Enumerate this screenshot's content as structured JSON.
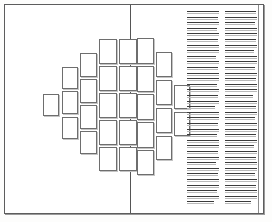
{
  "document": {
    "title": "Page Layout Mockup",
    "kind": "two-page-spread-wireframe",
    "description": "Bordered page spread with a diagonal cluster of photo placeholder tiles on the left and a two-column block of body-text rule lines on the right.",
    "canvas": {
      "width": 272,
      "height": 222,
      "background": "#ffffff"
    }
  },
  "frame": {
    "name": "outer-border",
    "x": 4,
    "y": 4,
    "width": 260,
    "height": 210,
    "stroke": "#5d5d5d",
    "shadow_stroke": "#9a9a9a",
    "inner_rule": {
      "name": "right-inner-rule",
      "x": 258,
      "y": 5,
      "height": 208,
      "stroke": "#8c8c8c"
    }
  },
  "spine": {
    "name": "vertical-divider",
    "x": 130,
    "y": 5,
    "height": 208,
    "stroke": "#555555"
  },
  "panels": {
    "left": {
      "name": "left-page",
      "x": 5,
      "y": 5,
      "width": 125,
      "height": 208
    },
    "right": {
      "name": "right-page",
      "x": 131,
      "y": 5,
      "width": 127,
      "height": 208
    }
  },
  "photo_grid": {
    "label": "photo-placeholder-cluster",
    "tile_stroke": "#6e6e6e",
    "tile_fill": "#ffffff",
    "tile_shadow": "#c4c4c4",
    "tile_count": 28,
    "tiles": [
      {
        "id": "t01",
        "x": 43,
        "y": 94,
        "w": 16,
        "h": 22
      },
      {
        "id": "t02",
        "x": 62,
        "y": 91,
        "w": 16,
        "h": 23
      },
      {
        "id": "t03",
        "x": 62,
        "y": 67,
        "w": 16,
        "h": 22
      },
      {
        "id": "t04",
        "x": 62,
        "y": 117,
        "w": 16,
        "h": 22
      },
      {
        "id": "t05",
        "x": 80,
        "y": 53,
        "w": 17,
        "h": 24
      },
      {
        "id": "t06",
        "x": 80,
        "y": 79,
        "w": 17,
        "h": 24
      },
      {
        "id": "t07",
        "x": 80,
        "y": 105,
        "w": 17,
        "h": 24
      },
      {
        "id": "t08",
        "x": 80,
        "y": 131,
        "w": 17,
        "h": 23
      },
      {
        "id": "t09",
        "x": 99,
        "y": 39,
        "w": 18,
        "h": 25
      },
      {
        "id": "t10",
        "x": 99,
        "y": 66,
        "w": 18,
        "h": 25
      },
      {
        "id": "t11",
        "x": 99,
        "y": 93,
        "w": 18,
        "h": 25
      },
      {
        "id": "t12",
        "x": 99,
        "y": 120,
        "w": 18,
        "h": 25
      },
      {
        "id": "t13",
        "x": 99,
        "y": 147,
        "w": 18,
        "h": 24
      },
      {
        "id": "t14",
        "x": 119,
        "y": 39,
        "w": 18,
        "h": 25
      },
      {
        "id": "t15",
        "x": 119,
        "y": 66,
        "w": 18,
        "h": 25
      },
      {
        "id": "t16",
        "x": 119,
        "y": 93,
        "w": 18,
        "h": 25
      },
      {
        "id": "t17",
        "x": 119,
        "y": 120,
        "w": 18,
        "h": 25
      },
      {
        "id": "t18",
        "x": 119,
        "y": 147,
        "w": 18,
        "h": 24
      },
      {
        "id": "t19",
        "x": 137,
        "y": 38,
        "w": 17,
        "h": 26
      },
      {
        "id": "t20",
        "x": 137,
        "y": 66,
        "w": 17,
        "h": 26
      },
      {
        "id": "t21",
        "x": 137,
        "y": 94,
        "w": 17,
        "h": 26
      },
      {
        "id": "t22",
        "x": 137,
        "y": 122,
        "w": 17,
        "h": 26
      },
      {
        "id": "t23",
        "x": 137,
        "y": 150,
        "w": 17,
        "h": 25
      },
      {
        "id": "t24",
        "x": 156,
        "y": 52,
        "w": 16,
        "h": 25
      },
      {
        "id": "t25",
        "x": 156,
        "y": 80,
        "w": 16,
        "h": 25
      },
      {
        "id": "t26",
        "x": 156,
        "y": 108,
        "w": 16,
        "h": 25
      },
      {
        "id": "t27",
        "x": 156,
        "y": 136,
        "w": 16,
        "h": 24
      },
      {
        "id": "t28",
        "x": 174,
        "y": 85,
        "w": 16,
        "h": 24
      },
      {
        "id": "t29",
        "x": 174,
        "y": 112,
        "w": 16,
        "h": 24
      }
    ]
  },
  "text_columns": {
    "label": "body-text-rule-lines",
    "block_x": 187,
    "block_y": 11,
    "line_stroke": "#3b3b3b",
    "underline_stroke": "#b9b9b9",
    "line_spacing": 5.6,
    "line_count_per_column": 35,
    "columns": [
      {
        "name": "text-column-left",
        "x": 0,
        "width": 32
      },
      {
        "name": "text-column-right",
        "x": 38,
        "width": 32
      }
    ],
    "line_widths": [
      32,
      31,
      32,
      30,
      32,
      31,
      32,
      32,
      29,
      32,
      31,
      32,
      32,
      30,
      32,
      31,
      32,
      28,
      32,
      32,
      31,
      32,
      30,
      32,
      32,
      31,
      32,
      29,
      32,
      31,
      32,
      32,
      30,
      32,
      27
    ],
    "line_widths_right": [
      31,
      32,
      30,
      32,
      32,
      31,
      32,
      29,
      32,
      32,
      30,
      32,
      31,
      32,
      32,
      28,
      32,
      31,
      32,
      30,
      32,
      32,
      31,
      32,
      29,
      32,
      31,
      32,
      32,
      30,
      32,
      31,
      32,
      32,
      26
    ]
  }
}
